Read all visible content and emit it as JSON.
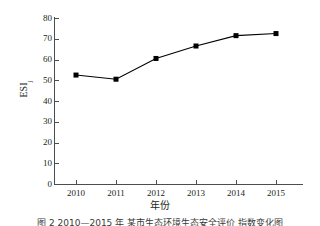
{
  "chart_data": {
    "type": "line",
    "title": "",
    "subtitle": "",
    "xlabel": "年份",
    "ylabel": "ESI",
    "ylabel_subscript": "j",
    "categories": [
      "2010",
      "2011",
      "2012",
      "2013",
      "2014",
      "2015"
    ],
    "x": [
      2010,
      2011,
      2012,
      2013,
      2014,
      2015
    ],
    "values": [
      52.5,
      50.5,
      60.5,
      66.5,
      71.5,
      72.5
    ],
    "series": [
      {
        "name": "ESIj",
        "values": [
          52.5,
          50.5,
          60.5,
          66.5,
          71.5,
          72.5
        ],
        "color": "#000000",
        "marker": "square",
        "line_style": "solid"
      }
    ],
    "ylim": [
      0,
      80
    ],
    "ytick_values": [
      0,
      10,
      20,
      30,
      40,
      50,
      60,
      70,
      80
    ],
    "ytick_labels": [
      "0",
      "10",
      "20",
      "30",
      "40",
      "50",
      "60",
      "70",
      "80"
    ],
    "xtick_labels": [
      "2010",
      "2011",
      "2012",
      "2013",
      "2014",
      "2015"
    ],
    "grid": false,
    "legend": false,
    "legend_position": "none",
    "tick_direction": "in",
    "spines": [
      "left",
      "bottom"
    ],
    "annotations": []
  },
  "caption": {
    "text": "图 2  2010—2015 年 某市生态环境生态安全评价 指数变化图"
  },
  "colors": {
    "line": "#000000",
    "marker": "#000000",
    "axis": "#4d4d4d",
    "text": "#231f20",
    "background": "#ffffff"
  }
}
